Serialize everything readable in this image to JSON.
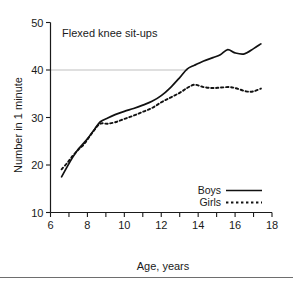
{
  "chart_data": {
    "type": "line",
    "title": "Flexed knee sit-ups",
    "xlabel": "Age, years",
    "ylabel": "Number in 1 minute",
    "xlim": [
      6,
      18
    ],
    "ylim": [
      10,
      50
    ],
    "xticks": [
      6,
      7,
      8,
      9,
      10,
      11,
      12,
      13,
      14,
      15,
      16,
      17,
      18
    ],
    "xtick_labels": [
      "6",
      "",
      "8",
      "",
      "10",
      "",
      "12",
      "",
      "14",
      "",
      "16",
      "",
      "18"
    ],
    "yticks": [
      10,
      20,
      30,
      40,
      50
    ],
    "ytick_labels": [
      "10",
      "20",
      "30",
      "40",
      "50"
    ],
    "grid": "horizontal gridline at y=40 only",
    "legend_position": "lower right inside axes",
    "series": [
      {
        "name": "Boys",
        "style": "solid",
        "x": [
          6.6,
          6.9,
          7.2,
          7.5,
          7.8,
          8.1,
          8.4,
          8.7,
          9.1,
          9.5,
          10.0,
          10.5,
          11.0,
          11.5,
          12.0,
          12.5,
          13.0,
          13.4,
          13.8,
          14.3,
          14.8,
          15.2,
          15.6,
          16.0,
          16.5,
          17.0,
          17.4
        ],
        "y": [
          17.5,
          19.6,
          21.6,
          23.3,
          24.6,
          26.0,
          27.6,
          29.1,
          29.9,
          30.6,
          31.3,
          31.9,
          32.6,
          33.4,
          34.6,
          36.3,
          38.4,
          40.2,
          41.0,
          41.9,
          42.6,
          43.2,
          44.3,
          43.6,
          43.4,
          44.5,
          45.5
        ]
      },
      {
        "name": "Girls",
        "style": "dotted",
        "x": [
          6.6,
          6.9,
          7.2,
          7.5,
          7.8,
          8.1,
          8.4,
          8.7,
          9.1,
          9.5,
          10.0,
          10.5,
          11.0,
          11.5,
          12.0,
          12.5,
          13.0,
          13.4,
          13.8,
          14.3,
          14.8,
          15.2,
          15.7,
          16.1,
          16.6,
          17.0,
          17.4
        ],
        "y": [
          19.1,
          20.4,
          21.9,
          23.2,
          24.3,
          25.9,
          27.5,
          28.7,
          28.7,
          29.0,
          29.7,
          30.4,
          31.2,
          32.0,
          33.2,
          34.2,
          35.2,
          36.2,
          36.9,
          36.4,
          36.2,
          36.3,
          36.4,
          36.1,
          35.5,
          35.5,
          36.1
        ]
      }
    ]
  },
  "legend": {
    "entries": [
      {
        "label": "Boys"
      },
      {
        "label": "Girls"
      }
    ]
  }
}
